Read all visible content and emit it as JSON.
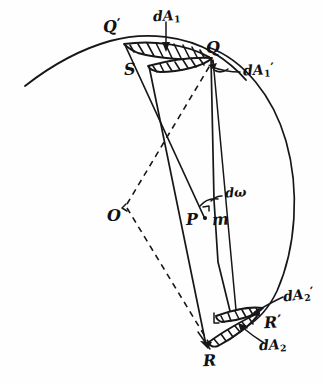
{
  "figure": {
    "ink_color": "#17171a",
    "background_color": "#fefefe",
    "width": 322,
    "height": 384
  },
  "points": {
    "q_prime": {
      "label": "Q",
      "prime": "′"
    },
    "q": {
      "label": "Q",
      "prime": ""
    },
    "s": {
      "label": "S",
      "prime": ""
    },
    "o": {
      "label": "O",
      "prime": ""
    },
    "p": {
      "label": "P",
      "prime": ""
    },
    "m": {
      "label": "m",
      "prime": ""
    },
    "r": {
      "label": "R",
      "prime": ""
    },
    "r_prime": {
      "label": "R",
      "prime": "′"
    }
  },
  "area_elements": {
    "dA1": {
      "base": "dA",
      "sub": "1",
      "prime": ""
    },
    "dA1_prime": {
      "base": "dA",
      "sub": "1",
      "prime": "′"
    },
    "dA2": {
      "base": "dA",
      "sub": "2",
      "prime": ""
    },
    "dA2_prime": {
      "base": "dA",
      "sub": "2",
      "prime": "′"
    }
  },
  "angles": {
    "d_omega": {
      "label": "dω"
    }
  }
}
